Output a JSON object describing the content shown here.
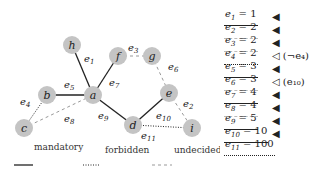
{
  "graph": {
    "nodes": [
      {
        "id": "h",
        "x": 72,
        "y": 45
      },
      {
        "id": "f",
        "x": 118,
        "y": 56
      },
      {
        "id": "g",
        "x": 152,
        "y": 56
      },
      {
        "id": "b",
        "x": 47,
        "y": 95
      },
      {
        "id": "a",
        "x": 93,
        "y": 95
      },
      {
        "id": "e",
        "x": 169,
        "y": 93
      },
      {
        "id": "c",
        "x": 24,
        "y": 128
      },
      {
        "id": "d",
        "x": 133,
        "y": 125
      },
      {
        "id": "i",
        "x": 192,
        "y": 128
      }
    ],
    "edges": [
      {
        "id": "e1",
        "from": "h",
        "to": "a",
        "type": "mandatory",
        "label": "e",
        "sub": "1",
        "lx": 84,
        "ly": 62
      },
      {
        "id": "e2",
        "from": "e",
        "to": "i",
        "type": "undecided",
        "label": "e",
        "sub": "2",
        "lx": 183,
        "ly": 107
      },
      {
        "id": "e3",
        "from": "f",
        "to": "g",
        "type": "undecided",
        "label": "e",
        "sub": "3",
        "lx": 128,
        "ly": 51
      },
      {
        "id": "e4",
        "from": "b",
        "to": "c",
        "type": "forbidden",
        "label": "e",
        "sub": "4",
        "lx": 20,
        "ly": 105
      },
      {
        "id": "e5",
        "from": "b",
        "to": "a",
        "type": "mandatory",
        "label": "e",
        "sub": "5",
        "lx": 64,
        "ly": 88
      },
      {
        "id": "e6",
        "from": "g",
        "to": "e",
        "type": "undecided",
        "label": "e",
        "sub": "6",
        "lx": 168,
        "ly": 70
      },
      {
        "id": "e7",
        "from": "f",
        "to": "a",
        "type": "mandatory",
        "label": "e",
        "sub": "7",
        "lx": 109,
        "ly": 86
      },
      {
        "id": "e8",
        "from": "c",
        "to": "a",
        "type": "undecided",
        "label": "e",
        "sub": "8",
        "lx": 64,
        "ly": 122
      },
      {
        "id": "e9",
        "from": "a",
        "to": "d",
        "type": "mandatory",
        "label": "e",
        "sub": "9",
        "lx": 98,
        "ly": 119
      },
      {
        "id": "e10",
        "from": "d",
        "to": "e",
        "type": "mandatory",
        "label": "e",
        "sub": "10",
        "lx": 156,
        "ly": 119
      },
      {
        "id": "e11",
        "from": "d",
        "to": "i",
        "type": "forbidden",
        "label": "e",
        "sub": "11",
        "lx": 141,
        "ly": 139
      }
    ]
  },
  "legend": {
    "mandatory": "mandatory",
    "forbidden": "forbidden",
    "undecided": "undecided"
  },
  "table": [
    {
      "var": "e",
      "sub": "1",
      "value": "1",
      "type": "mandatory",
      "marker": "◀",
      "note": ""
    },
    {
      "var": "e",
      "sub": "2",
      "value": "2",
      "type": "undecided",
      "marker": "◀",
      "note": ""
    },
    {
      "var": "e",
      "sub": "3",
      "value": "2",
      "type": "undecided",
      "marker": "◀",
      "note": ""
    },
    {
      "var": "e",
      "sub": "4",
      "value": "2",
      "type": "forbidden",
      "marker": "◁",
      "note": "(¬e₄)"
    },
    {
      "var": "e",
      "sub": "5",
      "value": "3",
      "type": "mandatory",
      "marker": "◀",
      "note": ""
    },
    {
      "var": "e",
      "sub": "6",
      "value": "3",
      "type": "undecided",
      "marker": "◁",
      "note": "(e₁₀)"
    },
    {
      "var": "e",
      "sub": "7",
      "value": "4",
      "type": "mandatory",
      "marker": "◀",
      "note": ""
    },
    {
      "var": "e",
      "sub": "8",
      "value": "4",
      "type": "undecided",
      "marker": "◀",
      "note": ""
    },
    {
      "var": "e",
      "sub": "9",
      "value": "5",
      "type": "mandatory",
      "marker": "◀",
      "note": ""
    },
    {
      "var": "e",
      "sub": "10",
      "value": "10",
      "type": "mandatory",
      "marker": "◀",
      "note": ""
    },
    {
      "var": "e",
      "sub": "11",
      "value": "100",
      "type": "forbidden",
      "marker": "",
      "note": ""
    }
  ]
}
